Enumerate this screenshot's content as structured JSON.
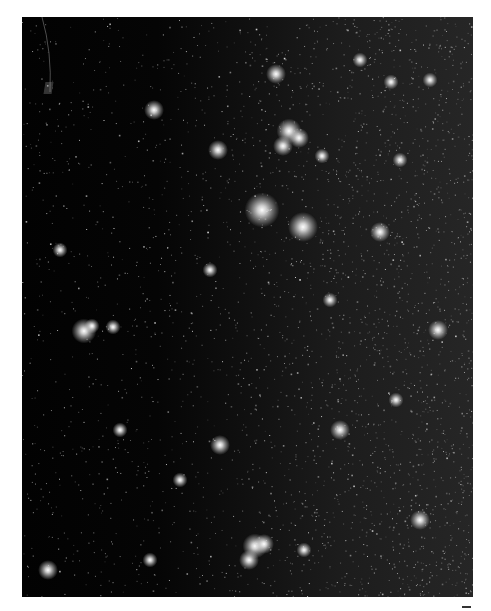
{
  "image": {
    "subject": "Dense star field (Milky Way region)",
    "frame": {
      "x": 22,
      "y": 17,
      "width": 451,
      "height": 580
    },
    "background_gradient": [
      "#020202",
      "#101010",
      "#262626"
    ],
    "faint_star_count": 3200,
    "seed": 1337,
    "bright_stars": [
      {
        "x": 262,
        "y": 210,
        "r": 7
      },
      {
        "x": 303,
        "y": 227,
        "r": 6
      },
      {
        "x": 154,
        "y": 110,
        "r": 4
      },
      {
        "x": 276,
        "y": 74,
        "r": 4
      },
      {
        "x": 289,
        "y": 131,
        "r": 5
      },
      {
        "x": 299,
        "y": 138,
        "r": 4
      },
      {
        "x": 283,
        "y": 146,
        "r": 4
      },
      {
        "x": 322,
        "y": 156,
        "r": 3
      },
      {
        "x": 84,
        "y": 331,
        "r": 5
      },
      {
        "x": 92,
        "y": 326,
        "r": 3
      },
      {
        "x": 113,
        "y": 327,
        "r": 3
      },
      {
        "x": 218,
        "y": 150,
        "r": 4
      },
      {
        "x": 380,
        "y": 232,
        "r": 4
      },
      {
        "x": 391,
        "y": 82,
        "r": 3
      },
      {
        "x": 430,
        "y": 80,
        "r": 3
      },
      {
        "x": 48,
        "y": 570,
        "r": 4
      },
      {
        "x": 255,
        "y": 546,
        "r": 5
      },
      {
        "x": 264,
        "y": 544,
        "r": 4
      },
      {
        "x": 249,
        "y": 560,
        "r": 4
      },
      {
        "x": 304,
        "y": 550,
        "r": 3
      },
      {
        "x": 220,
        "y": 445,
        "r": 4
      },
      {
        "x": 340,
        "y": 430,
        "r": 4
      },
      {
        "x": 420,
        "y": 520,
        "r": 4
      },
      {
        "x": 180,
        "y": 480,
        "r": 3
      },
      {
        "x": 396,
        "y": 400,
        "r": 3
      },
      {
        "x": 120,
        "y": 430,
        "r": 3
      },
      {
        "x": 438,
        "y": 330,
        "r": 4
      },
      {
        "x": 60,
        "y": 250,
        "r": 3
      },
      {
        "x": 360,
        "y": 60,
        "r": 3
      },
      {
        "x": 210,
        "y": 270,
        "r": 3
      },
      {
        "x": 330,
        "y": 300,
        "r": 3
      },
      {
        "x": 150,
        "y": 560,
        "r": 3
      },
      {
        "x": 400,
        "y": 160,
        "r": 3
      }
    ],
    "streak": {
      "x1": 20,
      "y1": 0,
      "x2": 28,
      "y2": 75,
      "color": "#9a9a9a"
    }
  },
  "side_text": "",
  "corner_mark": ""
}
